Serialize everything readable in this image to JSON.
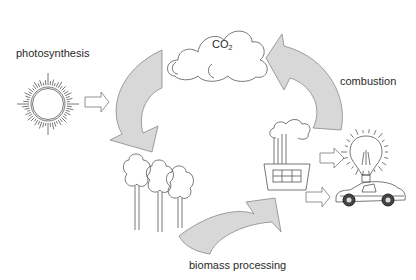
{
  "diagram": {
    "nodes": {
      "co2": {
        "label": "CO",
        "subscript": "2"
      },
      "sun": {
        "icon": "sun-icon"
      },
      "trees": {
        "icon": "trees-icon"
      },
      "factory": {
        "icon": "factory-icon"
      },
      "lightbulb": {
        "icon": "lightbulb-icon"
      },
      "car": {
        "icon": "car-icon"
      }
    },
    "labels": {
      "photosynthesis": "photosynthesis",
      "combustion": "combustion",
      "biomass_processing": "biomass processing"
    },
    "flows": [
      {
        "from": "sun",
        "to": "cycle",
        "label": "photosynthesis"
      },
      {
        "from": "co2",
        "to": "trees"
      },
      {
        "from": "trees",
        "to": "factory",
        "label": "biomass processing"
      },
      {
        "from": "factory",
        "to": "co2",
        "label": "combustion"
      },
      {
        "from": "factory",
        "to": "lightbulb"
      },
      {
        "from": "factory",
        "to": "car"
      }
    ],
    "colors": {
      "arrow_fill": "#d8d8d8",
      "line": "#555555"
    }
  }
}
